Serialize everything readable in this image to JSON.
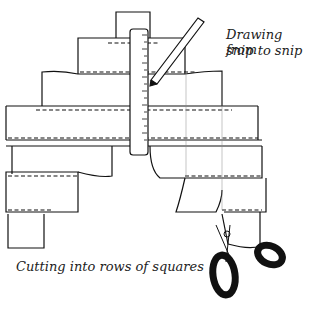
{
  "labels": {
    "drawing_line1": "Drawing from",
    "drawing_line2": "snip to snip",
    "cutting": "Cutting into rows of squares"
  },
  "colors": {
    "ink": "#111111",
    "paper": "#ffffff"
  }
}
